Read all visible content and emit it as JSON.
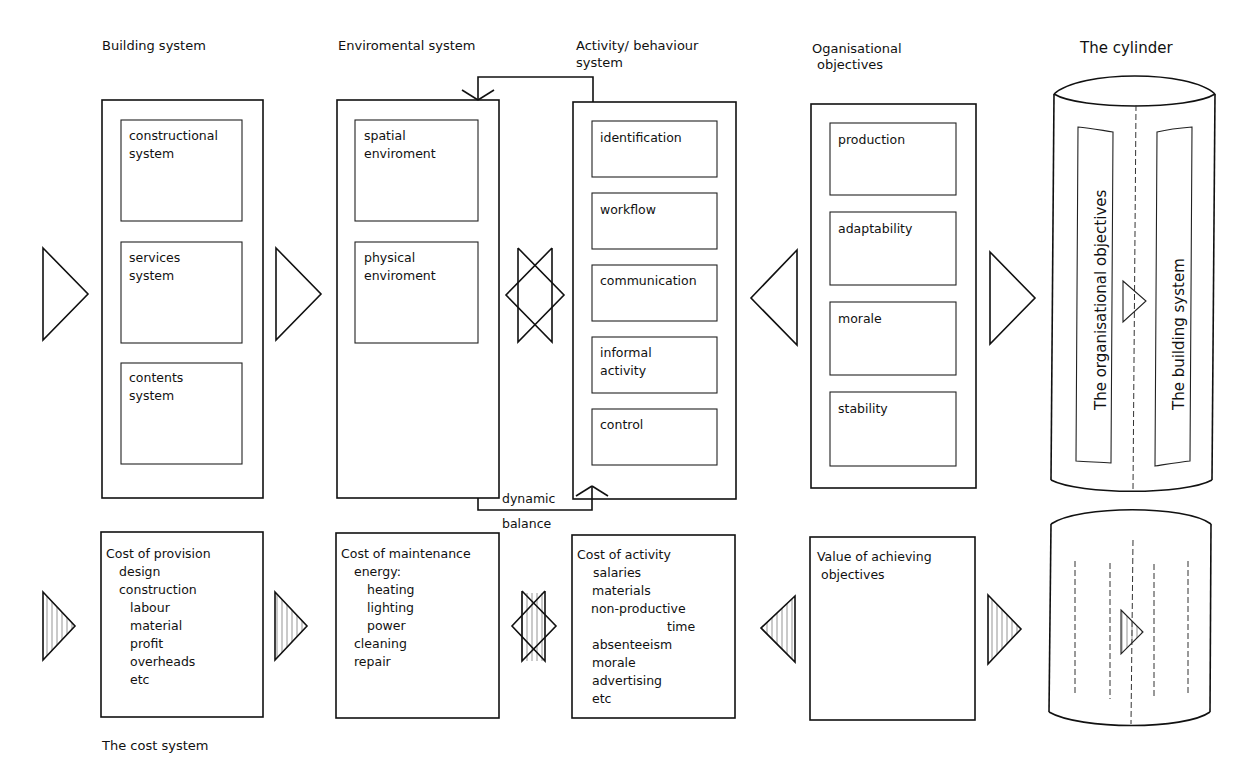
{
  "headings": {
    "building": "Building system",
    "environmental": "Enviromental system",
    "activity_1": "Activity/ behaviour",
    "activity_2": "system",
    "organisational_1": "Oganisational",
    "organisational_2": "objectives",
    "cylinder": "The cylinder"
  },
  "building_system": {
    "subsystems": [
      [
        "constructional",
        "system"
      ],
      [
        "services",
        "system"
      ],
      [
        "contents",
        "system"
      ]
    ]
  },
  "environmental_system": {
    "subsystems": [
      [
        "spatial",
        "enviroment"
      ],
      [
        "physical",
        "enviroment"
      ]
    ]
  },
  "activity_system": {
    "subsystems": [
      [
        "identification"
      ],
      [
        "workflow"
      ],
      [
        "communication"
      ],
      [
        "informal",
        "activity"
      ],
      [
        "control"
      ]
    ]
  },
  "organisational_objectives": {
    "items": [
      [
        "production"
      ],
      [
        "adaptability"
      ],
      [
        "morale"
      ],
      [
        "stability"
      ]
    ]
  },
  "cylinder": {
    "left_panel": "The organisational objectives",
    "right_panel": "The building system"
  },
  "dynamic_balance": {
    "line1": "dynamic",
    "line2": "balance"
  },
  "cost_system": {
    "caption": "The cost system",
    "provision": {
      "title": "Cost of provision",
      "lines": [
        {
          "text": "design",
          "indent": 1
        },
        {
          "text": "construction",
          "indent": 1
        },
        {
          "text": "labour",
          "indent": 2
        },
        {
          "text": "material",
          "indent": 2
        },
        {
          "text": "profit",
          "indent": 2
        },
        {
          "text": "overheads",
          "indent": 2
        },
        {
          "text": "etc",
          "indent": 2
        }
      ]
    },
    "maintenance": {
      "title": "Cost of maintenance",
      "lines": [
        {
          "text": "energy:",
          "indent": 1
        },
        {
          "text": "heating",
          "indent": 2
        },
        {
          "text": "lighting",
          "indent": 2
        },
        {
          "text": "power",
          "indent": 2
        },
        {
          "text": "cleaning",
          "indent": 1
        },
        {
          "text": "repair",
          "indent": 1
        }
      ]
    },
    "activity": {
      "title": "Cost of activity",
      "lines": [
        {
          "text": "salaries",
          "indent": 1
        },
        {
          "text": "materials",
          "indent": 1
        },
        {
          "text": "non-productive",
          "indent": 1
        },
        {
          "text": "time",
          "indent": 5
        },
        {
          "text": "absenteeism",
          "indent": 1
        },
        {
          "text": "morale",
          "indent": 1
        },
        {
          "text": "advertising",
          "indent": 1
        },
        {
          "text": "etc",
          "indent": 1
        }
      ]
    },
    "value": {
      "title": "Value of achieving",
      "lines": [
        {
          "text": "objectives",
          "indent": 1
        }
      ]
    }
  },
  "colors": {
    "line": "#111111",
    "background": "#ffffff"
  }
}
